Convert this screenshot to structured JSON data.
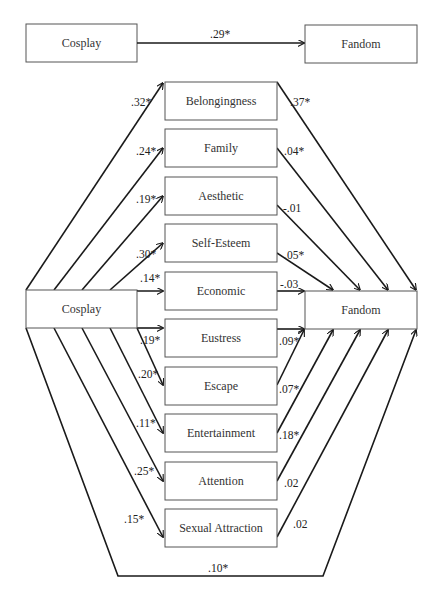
{
  "diagram": {
    "type": "mediation-path-model",
    "total_effect": {
      "predictor": "Cosplay",
      "outcome": "Fandom",
      "coefficient": ".29*"
    },
    "model": {
      "predictor": "Cosplay",
      "outcome": "Fandom",
      "direct_effect": ".10*",
      "mediators": [
        {
          "name": "Belongingness",
          "a_path": ".32*",
          "b_path": ".37*"
        },
        {
          "name": "Family",
          "a_path": ".24*",
          "b_path": ".04*"
        },
        {
          "name": "Aesthetic",
          "a_path": ".19*",
          "b_path": "-.01"
        },
        {
          "name": "Self-Esteem",
          "a_path": ".30*",
          "b_path": ".05*"
        },
        {
          "name": "Economic",
          "a_path": ".14*",
          "b_path": "-.03"
        },
        {
          "name": "Eustress",
          "a_path": ".19*",
          "b_path": ".09*"
        },
        {
          "name": "Escape",
          "a_path": ".20*",
          "b_path": ".07*"
        },
        {
          "name": "Entertainment",
          "a_path": ".11*",
          "b_path": ".18*"
        },
        {
          "name": "Attention",
          "a_path": ".25*",
          "b_path": ".02"
        },
        {
          "name": "Sexual Attraction",
          "a_path": ".15*",
          "b_path": ".02"
        }
      ]
    },
    "colors": {
      "line": "#1a1a1a",
      "box_border": "#555555",
      "text": "#222222",
      "background": "#ffffff"
    }
  }
}
